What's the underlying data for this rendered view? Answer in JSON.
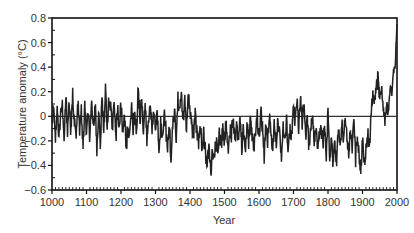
{
  "chart_data": {
    "type": "line",
    "title": "",
    "xlabel": "Year",
    "ylabel": "Temperature anomaly (°C)",
    "xlim": [
      1000,
      2000
    ],
    "ylim": [
      -0.6,
      0.8
    ],
    "x_ticks": [
      1000,
      1100,
      1200,
      1300,
      1400,
      1500,
      1600,
      1700,
      1800,
      1900,
      2000
    ],
    "y_ticks": [
      -0.6,
      -0.4,
      -0.2,
      0,
      0.2,
      0.4,
      0.6,
      0.8
    ],
    "y_tick_labels": [
      "−0.6",
      "−0.4",
      "−0.2",
      "0",
      "0.2",
      "0.4",
      "0.6",
      "0.8"
    ],
    "reference_line": 0,
    "grid": false,
    "legend": null,
    "series": [
      {
        "name": "Temperature anomaly",
        "color": "#222222",
        "x": [
          1000,
          1005,
          1010,
          1015,
          1020,
          1025,
          1030,
          1035,
          1040,
          1045,
          1050,
          1055,
          1060,
          1065,
          1070,
          1075,
          1080,
          1085,
          1090,
          1095,
          1100,
          1105,
          1110,
          1115,
          1120,
          1125,
          1130,
          1135,
          1140,
          1145,
          1150,
          1155,
          1160,
          1165,
          1170,
          1175,
          1180,
          1185,
          1190,
          1195,
          1200,
          1205,
          1210,
          1215,
          1220,
          1225,
          1230,
          1235,
          1240,
          1245,
          1250,
          1255,
          1260,
          1265,
          1270,
          1275,
          1280,
          1285,
          1290,
          1295,
          1300,
          1305,
          1310,
          1315,
          1320,
          1325,
          1330,
          1335,
          1340,
          1345,
          1350,
          1355,
          1360,
          1365,
          1370,
          1375,
          1380,
          1385,
          1390,
          1395,
          1400,
          1405,
          1410,
          1415,
          1420,
          1425,
          1430,
          1435,
          1440,
          1445,
          1450,
          1455,
          1460,
          1465,
          1470,
          1475,
          1480,
          1485,
          1490,
          1495,
          1500,
          1505,
          1510,
          1515,
          1520,
          1525,
          1530,
          1535,
          1540,
          1545,
          1550,
          1555,
          1560,
          1565,
          1570,
          1575,
          1580,
          1585,
          1590,
          1595,
          1600,
          1605,
          1610,
          1615,
          1620,
          1625,
          1630,
          1635,
          1640,
          1645,
          1650,
          1655,
          1660,
          1665,
          1670,
          1675,
          1680,
          1685,
          1690,
          1695,
          1700,
          1705,
          1710,
          1715,
          1720,
          1725,
          1730,
          1735,
          1740,
          1745,
          1750,
          1755,
          1760,
          1765,
          1770,
          1775,
          1780,
          1785,
          1790,
          1795,
          1800,
          1805,
          1810,
          1815,
          1820,
          1825,
          1830,
          1835,
          1840,
          1845,
          1850,
          1855,
          1860,
          1865,
          1870,
          1875,
          1880,
          1885,
          1890,
          1895,
          1900,
          1905,
          1910,
          1915,
          1920,
          1925,
          1930,
          1935,
          1940,
          1945,
          1950,
          1955,
          1960,
          1965,
          1970,
          1975,
          1980,
          1985,
          1990,
          1995,
          2000
        ],
        "values": [
          -0.05,
          0.12,
          -0.18,
          0.1,
          -0.2,
          0.05,
          0.08,
          -0.22,
          0.15,
          -0.1,
          0.12,
          -0.15,
          0.18,
          -0.05,
          -0.18,
          0.1,
          -0.12,
          0.05,
          -0.25,
          0.08,
          -0.15,
          0.02,
          -0.2,
          0.1,
          -0.08,
          0.12,
          -0.28,
          0.05,
          -0.25,
          0.15,
          -0.1,
          0.2,
          -0.05,
          0.12,
          0.05,
          -0.12,
          0.18,
          -0.2,
          0.08,
          -0.1,
          0.1,
          -0.15,
          0.05,
          -0.3,
          -0.05,
          -0.2,
          0.1,
          -0.1,
          0.05,
          -0.15,
          0.25,
          -0.05,
          0.18,
          -0.12,
          0.1,
          -0.2,
          -0.05,
          0.15,
          -0.15,
          0.05,
          -0.1,
          0.02,
          -0.25,
          -0.05,
          -0.2,
          0.05,
          -0.1,
          -0.3,
          -0.05,
          -0.35,
          -0.1,
          0.05,
          -0.2,
          0.15,
          0.02,
          0.2,
          -0.05,
          0.12,
          -0.1,
          0.15,
          0.05,
          -0.08,
          -0.15,
          0.0,
          -0.12,
          -0.2,
          -0.08,
          -0.25,
          -0.15,
          -0.3,
          -0.4,
          -0.25,
          -0.45,
          -0.3,
          -0.38,
          -0.2,
          -0.3,
          -0.12,
          -0.25,
          -0.1,
          -0.2,
          -0.05,
          -0.28,
          -0.1,
          -0.15,
          0.02,
          -0.22,
          -0.05,
          -0.18,
          0.0,
          -0.25,
          -0.1,
          -0.3,
          -0.08,
          -0.2,
          -0.02,
          -0.15,
          -0.3,
          -0.1,
          0.0,
          -0.2,
          0.05,
          -0.1,
          -0.35,
          -0.05,
          -0.2,
          0.02,
          -0.15,
          -0.25,
          -0.05,
          -0.2,
          0.0,
          -0.15,
          -0.3,
          -0.1,
          -0.22,
          -0.05,
          -0.28,
          -0.1,
          -0.15,
          0.05,
          -0.05,
          0.12,
          -0.1,
          0.15,
          -0.05,
          0.08,
          -0.15,
          -0.05,
          -0.25,
          -0.1,
          0.02,
          -0.2,
          -0.08,
          -0.3,
          -0.15,
          -0.05,
          -0.22,
          -0.1,
          -0.3,
          0.02,
          -0.35,
          -0.15,
          -0.4,
          -0.2,
          -0.38,
          -0.1,
          -0.25,
          -0.05,
          -0.2,
          0.02,
          -0.15,
          -0.3,
          -0.1,
          -0.25,
          -0.05,
          -0.35,
          -0.15,
          -0.3,
          -0.45,
          -0.2,
          -0.4,
          -0.25,
          -0.1,
          -0.3,
          0.05,
          0.2,
          0.1,
          0.25,
          0.3,
          0.15,
          0.25,
          0.05,
          -0.05,
          0.1,
          0.0,
          0.25,
          0.2,
          0.35,
          0.45,
          0.75
        ]
      }
    ]
  },
  "plot": {
    "left": 52,
    "right": 397,
    "top": 18,
    "bottom": 190
  }
}
